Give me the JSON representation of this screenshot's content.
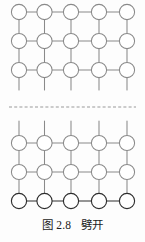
{
  "figure": {
    "caption": "图 2.8   劈开",
    "caption_label": "图 2.8",
    "caption_title": "劈开",
    "figure_number": "2.8",
    "alt_description": "晶体劈开示意图：上下两块晶格沿虚线分离，断裂面上留有悬挂键",
    "colors": {
      "background": "#fdfdfd",
      "lattice_stroke": "#8a8a8a",
      "lattice_stroke_dark": "#4a4a4a",
      "bottom_row_stroke": "#2e2e2e",
      "dashed_line": "#9a9a9a",
      "circle_fill": "#ffffff",
      "caption_text": "#1b1b1b"
    },
    "cleavage_line": {
      "name": "劈开面",
      "style": "dashed",
      "y": 107,
      "x_start": 9,
      "x_end": 136,
      "dash": "3 2.2",
      "stroke_width": 1.1
    },
    "geometry": {
      "columns_x": [
        19,
        44.5,
        71,
        99,
        127
      ],
      "top_rows_y": [
        12,
        41,
        70
      ],
      "bottom_rows_y": [
        143,
        172,
        201
      ],
      "circle_radius": 7.6,
      "stroke_width": 1.05,
      "top_stub_end_y": 90,
      "bottom_stub_start_y": 121
    },
    "blocks": [
      {
        "id": "upper-crystal",
        "name": "上半晶体",
        "rows": 3,
        "cols": 5,
        "dangling_bonds": 5,
        "dangling_direction": "down"
      },
      {
        "id": "lower-crystal",
        "name": "下半晶体",
        "rows": 3,
        "cols": 5,
        "dangling_bonds": 5,
        "dangling_direction": "up"
      }
    ]
  }
}
